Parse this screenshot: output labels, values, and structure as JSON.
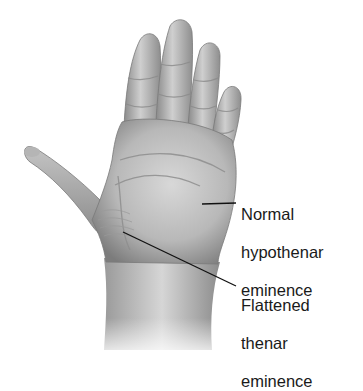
{
  "figure": {
    "labels": {
      "hypothenar": [
        "Normal",
        "hypothenar",
        "eminence"
      ],
      "thenar": [
        "Flattened",
        "thenar",
        "eminence"
      ]
    },
    "colors": {
      "text": "#1a1a1a",
      "leader_line": "#111111",
      "skin_light": "#d2d2d2",
      "skin_mid": "#a9a9a9",
      "skin_dark": "#6e6e6e",
      "background": "#ffffff"
    }
  }
}
